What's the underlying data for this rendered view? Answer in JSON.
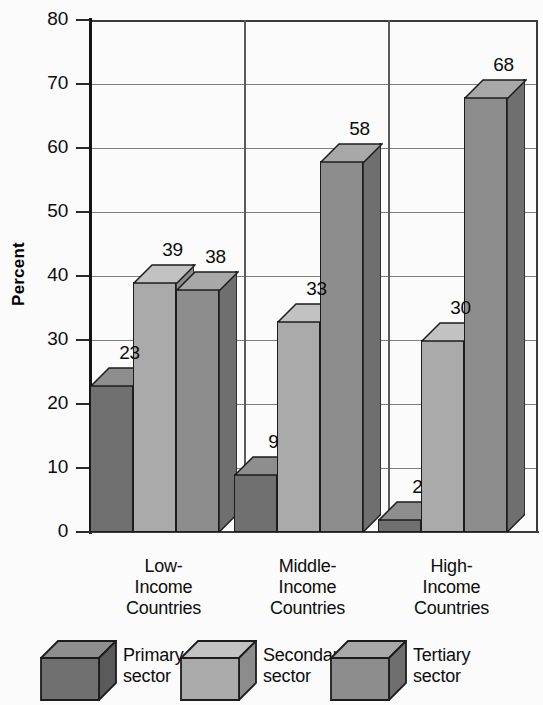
{
  "chart_data": {
    "type": "bar",
    "title": "",
    "xlabel": "",
    "ylabel": "Percent",
    "ylim": [
      0,
      80
    ],
    "ytick_step": 10,
    "grid": true,
    "legend_position": "bottom",
    "categories": [
      "Low-Income Countries",
      "Middle-Income Countries",
      "High-Income Countries"
    ],
    "category_lines": [
      [
        "Low-",
        "Income",
        "Countries"
      ],
      [
        "Middle-",
        "Income",
        "Countries"
      ],
      [
        "High-",
        "Income",
        "Countries"
      ]
    ],
    "yticks": [
      "0",
      "10",
      "20",
      "30",
      "40",
      "50",
      "60",
      "70",
      "80"
    ],
    "series": [
      {
        "name": "Primary sector",
        "values": [
          23,
          9,
          2
        ],
        "color": "#707070",
        "side_color": "#5a5a5a",
        "top_color": "#8e8e8e"
      },
      {
        "name": "Secondary sector",
        "values": [
          39,
          33,
          30
        ],
        "color": "#abaaab",
        "side_color": "#8c8c8c",
        "top_color": "#c2c2c2"
      },
      {
        "name": "Tertiary sector",
        "values": [
          38,
          58,
          68
        ],
        "color": "#8d8d8d",
        "side_color": "#6f6f6f",
        "top_color": "#a8a8a8"
      }
    ]
  },
  "axis": {
    "y_title": "Percent"
  },
  "legend": {
    "items": [
      {
        "line1": "Primary",
        "line2": "sector"
      },
      {
        "line1": "Secondary",
        "line2": "sector"
      },
      {
        "line1": "Tertiary",
        "line2": "sector"
      }
    ]
  },
  "labels": {
    "low": {
      "primary": "23",
      "secondary": "39",
      "tertiary": "38"
    },
    "middle": {
      "primary": "9",
      "secondary": "33",
      "tertiary": "58"
    },
    "high": {
      "primary": "2",
      "secondary": "30",
      "tertiary": "68"
    }
  },
  "colors": {
    "background": "#fbfbfb",
    "axis": "#141414",
    "grid": "#7d7d7d",
    "text": "#0d0d0d"
  }
}
